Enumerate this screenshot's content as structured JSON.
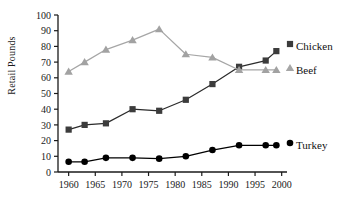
{
  "chart_data": {
    "type": "line",
    "title": "",
    "xlabel": "",
    "ylabel": "Retail Pounds",
    "x": [
      1960,
      1963,
      1967,
      1972,
      1977,
      1982,
      1987,
      1992,
      1997,
      1999
    ],
    "xlim": [
      1958,
      2001
    ],
    "ylim": [
      0,
      100
    ],
    "xticks": [
      1960,
      1965,
      1970,
      1975,
      1980,
      1985,
      1990,
      1995,
      2000
    ],
    "xticklabels": [
      "1960",
      "1965",
      "1970",
      "1975",
      "1980",
      "1985",
      "1990",
      "1995",
      "2000"
    ],
    "yticks": [
      0,
      10,
      20,
      30,
      40,
      50,
      60,
      70,
      80,
      90,
      100
    ],
    "yticklabels": [
      "0",
      "10",
      "20",
      "30",
      "40",
      "50",
      "60",
      "70",
      "80",
      "90",
      "100"
    ],
    "grid": false,
    "legend_position": "right-inline",
    "series": [
      {
        "name": "Chicken",
        "marker": "square",
        "color": "#3c3c3c",
        "line_color": "#2b2b2b",
        "values": [
          27,
          30,
          31,
          40,
          39,
          46,
          56,
          67,
          71,
          77
        ]
      },
      {
        "name": "Beef",
        "marker": "triangle",
        "color": "#a2a2a2",
        "line_color": "#a6a6a6",
        "values": [
          64,
          70,
          78,
          84,
          91,
          75,
          73,
          65,
          65,
          65
        ]
      },
      {
        "name": "Turkey",
        "marker": "circle",
        "color": "#000000",
        "line_color": "#000000",
        "values": [
          6.5,
          6.5,
          9,
          9,
          8.5,
          10,
          14,
          17,
          17,
          17
        ]
      }
    ]
  },
  "axes": {
    "y_title": "Retail Pounds"
  },
  "legend": {
    "chicken_label": "Chicken",
    "beef_label": "Beef",
    "turkey_label": "Turkey"
  },
  "colors": {
    "axis": "#1a1a1a",
    "chicken": "#3c3c3c",
    "beef": "#a6a6a6",
    "turkey": "#000000",
    "background": "#ffffff"
  }
}
